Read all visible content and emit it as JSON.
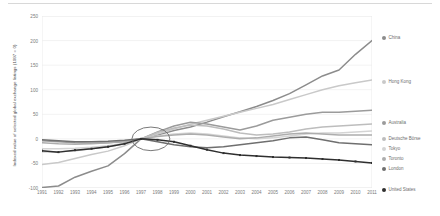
{
  "chart_data": {
    "type": "line",
    "title": "",
    "xlabel": "",
    "ylabel": "Indexed value of selected global exchange listings (1997 = 0)",
    "xlim": [
      1991,
      2011
    ],
    "ylim": [
      -100,
      250
    ],
    "yticks": [
      250,
      200,
      150,
      100,
      50,
      0,
      -50,
      -100
    ],
    "ytick_labels": [
      "250",
      "200",
      "150",
      "100",
      "50",
      "0",
      "-50",
      "-100"
    ],
    "x": [
      1991,
      1992,
      1993,
      1994,
      1995,
      1996,
      1997,
      1998,
      1999,
      2000,
      2001,
      2002,
      2003,
      2004,
      2005,
      2006,
      2007,
      2008,
      2009,
      2010,
      2011
    ],
    "xtick_labels": [
      "1991",
      "1992",
      "1993",
      "1994",
      "1995",
      "1996",
      "1997",
      "1998",
      "1999",
      "2000",
      "2001",
      "2002",
      "2003",
      "2004",
      "2005",
      "2006",
      "2007",
      "2008",
      "2009",
      "2010",
      "2011"
    ],
    "grid": true,
    "grid_axis": "y",
    "legend_position": "right",
    "annotation": {
      "shape": "ellipse",
      "label": "convergence-1997",
      "x_center": 1997.6,
      "y_center": 0,
      "x_radius": 1.15,
      "y_radius": 24
    },
    "series": [
      {
        "name": "China",
        "color": "#8c8c8c",
        "marker": false,
        "values": [
          -99,
          -96,
          -78,
          -66,
          -55,
          -30,
          0,
          8,
          17,
          24,
          34,
          45,
          55,
          66,
          78,
          92,
          110,
          128,
          140,
          172,
          200
        ]
      },
      {
        "name": "Hong Kong",
        "color": "#c9c9c9",
        "marker": false,
        "values": [
          -52,
          -48,
          -40,
          -32,
          -25,
          -14,
          0,
          10,
          20,
          30,
          38,
          46,
          54,
          62,
          70,
          80,
          90,
          100,
          108,
          114,
          120
        ]
      },
      {
        "name": "Australia",
        "color": "#9b9b9b",
        "marker": false,
        "values": [
          -4,
          -6,
          -8,
          -9,
          -8,
          -6,
          0,
          14,
          26,
          34,
          30,
          24,
          18,
          26,
          38,
          44,
          50,
          54,
          54,
          56,
          58
        ]
      },
      {
        "name": "Deutsche Börse",
        "color": "#bdbdbd",
        "marker": false,
        "values": [
          -26,
          -26,
          -24,
          -20,
          -16,
          -10,
          0,
          13,
          22,
          28,
          26,
          20,
          12,
          8,
          10,
          14,
          20,
          24,
          26,
          28,
          30
        ]
      },
      {
        "name": "Tokyo",
        "color": "#d4d4d4",
        "marker": false,
        "values": [
          -20,
          -20,
          -19,
          -17,
          -14,
          -9,
          0,
          6,
          10,
          12,
          10,
          6,
          2,
          0,
          2,
          6,
          10,
          12,
          12,
          14,
          16
        ]
      },
      {
        "name": "Toronto",
        "color": "#adadad",
        "marker": false,
        "values": [
          -8,
          -10,
          -11,
          -10,
          -8,
          -5,
          0,
          5,
          8,
          10,
          8,
          4,
          0,
          2,
          6,
          10,
          12,
          10,
          8,
          8,
          8
        ]
      },
      {
        "name": "London",
        "color": "#6f6f6f",
        "marker": false,
        "values": [
          -2,
          -4,
          -6,
          -6,
          -5,
          -3,
          0,
          -6,
          -12,
          -16,
          -18,
          -16,
          -12,
          -8,
          -4,
          2,
          4,
          -2,
          -8,
          -10,
          -12
        ]
      },
      {
        "name": "United States",
        "color": "#2f2f2f",
        "marker": true,
        "values": [
          -24,
          -27,
          -23,
          -20,
          -16,
          -10,
          0,
          -2,
          -6,
          -14,
          -22,
          -29,
          -33,
          -35,
          -37,
          -38,
          -39,
          -41,
          -43,
          -46,
          -49
        ]
      }
    ]
  },
  "legend": {
    "items": [
      {
        "label": "China",
        "color": "#8c8c8c",
        "y": 19
      },
      {
        "label": "Hong Kong",
        "color": "#c9c9c9",
        "y": 63
      },
      {
        "label": "Australia",
        "color": "#9b9b9b",
        "y": 104
      },
      {
        "label": "Deutsche Börse",
        "color": "#bdbdbd",
        "y": 120
      },
      {
        "label": "Tokyo",
        "color": "#d4d4d4",
        "y": 130
      },
      {
        "label": "Toronto",
        "color": "#adadad",
        "y": 140
      },
      {
        "label": "London",
        "color": "#6f6f6f",
        "y": 150
      },
      {
        "label": "United States",
        "color": "#2f2f2f",
        "y": 171
      }
    ]
  }
}
